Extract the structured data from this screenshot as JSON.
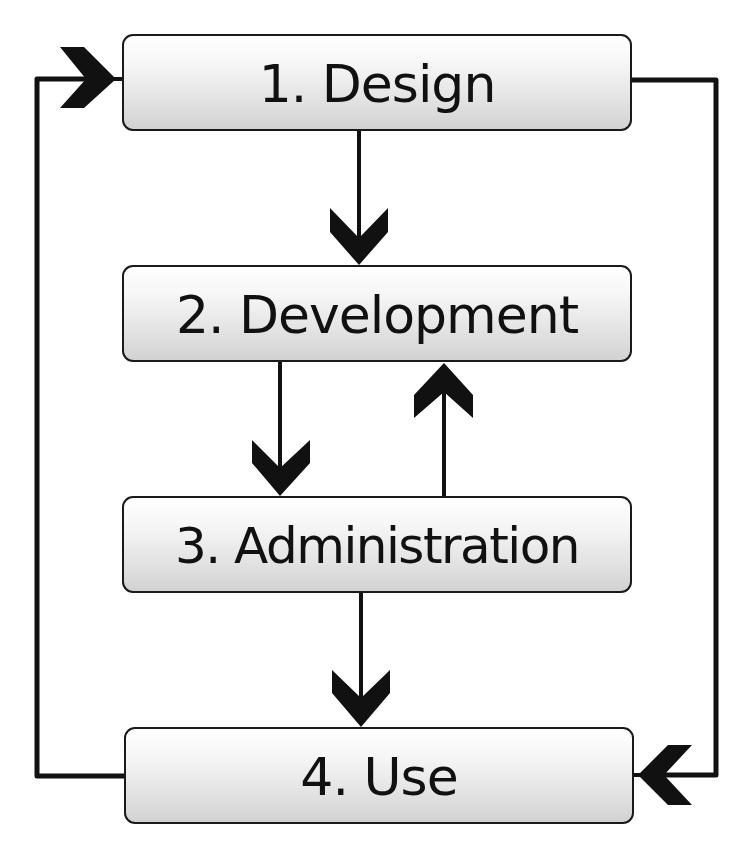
{
  "diagram": {
    "type": "lifecycle-flow",
    "stages": [
      {
        "number": "1.",
        "name": "Design",
        "label": "1. Design"
      },
      {
        "number": "2.",
        "name": "Development",
        "label": "2. Development"
      },
      {
        "number": "3.",
        "name": "Administration",
        "label": "3. Administration"
      },
      {
        "number": "4.",
        "name": "Use",
        "label": "4. Use"
      }
    ],
    "connections": [
      {
        "from": "1. Design",
        "to": "2. Development",
        "direction": "down"
      },
      {
        "from": "2. Development",
        "to": "3. Administration",
        "direction": "down"
      },
      {
        "from": "3. Administration",
        "to": "2. Development",
        "direction": "up"
      },
      {
        "from": "3. Administration",
        "to": "4. Use",
        "direction": "down"
      },
      {
        "from": "4. Use",
        "to": "1. Design",
        "direction": "loop-left"
      },
      {
        "from": "1. Design",
        "to": "4. Use",
        "direction": "loop-right"
      }
    ],
    "colors": {
      "line": "#111111",
      "box_border": "#1a1a1a",
      "box_gradient_top": "#ffffff",
      "box_gradient_bottom": "#d2d2d2",
      "text": "#111111",
      "background": "#ffffff"
    }
  }
}
